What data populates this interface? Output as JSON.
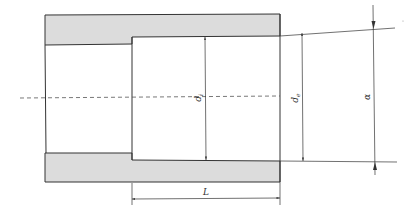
{
  "diagram": {
    "type": "pipe socket cross-section",
    "colors": {
      "wall_fill": "#dcdcdc",
      "line": "#333333",
      "background": "#ffffff"
    },
    "labels": {
      "inner_diameter": "d",
      "inner_diameter_sub": "i",
      "socket_diameter": "d",
      "socket_diameter_sub": "e",
      "outer_dimension": "α",
      "length": "L"
    }
  }
}
